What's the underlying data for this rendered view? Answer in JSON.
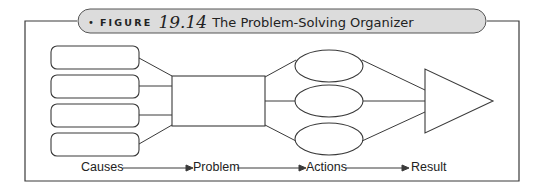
{
  "header": {
    "bullet": "•",
    "figure_word": "FIGURE",
    "figure_number": "19.14",
    "title": "The Problem-Solving Organizer"
  },
  "diagram": {
    "causes": [
      "",
      "",
      "",
      ""
    ],
    "problem": "",
    "actions": [
      "",
      "",
      ""
    ],
    "result": ""
  },
  "flow_labels": {
    "causes": "Causes",
    "problem": "Problem",
    "actions": "Actions",
    "result": "Result"
  },
  "colors": {
    "stroke": "#3a3a3a",
    "pill_fill": "#dcdcdc",
    "background": "#ffffff"
  }
}
